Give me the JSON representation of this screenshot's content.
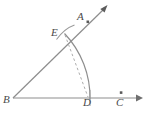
{
  "figure": {
    "type": "geometric-construction",
    "background_color": "#ffffff",
    "stroke_color": "#8d8d8d",
    "label_color": "#4a4a4a",
    "dashed_color": "#a8a8a8",
    "labels": {
      "A": "A",
      "B": "B",
      "C": "C",
      "D": "D",
      "E": "E"
    },
    "points": [
      {
        "name": "A",
        "label": "A",
        "x": 88,
        "y": 22,
        "marked": true
      },
      {
        "name": "B",
        "label": "B",
        "x": 13,
        "y": 98,
        "marked": false
      },
      {
        "name": "C",
        "label": "C",
        "x": 121,
        "y": 93,
        "marked": true
      },
      {
        "name": "D",
        "label": "D",
        "x": 89,
        "y": 98,
        "marked": false
      },
      {
        "name": "E",
        "label": "E",
        "x": 64,
        "y": 33,
        "marked": false
      }
    ],
    "rays": [
      {
        "name": "ray-BC",
        "from": "B",
        "through": "D",
        "to_x": 140,
        "to_y": 98,
        "arrow": true
      },
      {
        "name": "ray-BA",
        "from": "B",
        "through": "E",
        "to_x": 106,
        "to_y": 7,
        "arrow": true
      }
    ],
    "arcs": [
      {
        "name": "main-arc",
        "center": "B",
        "from": "E",
        "to": "D",
        "radius": 93,
        "style": "solid"
      },
      {
        "name": "construction-arc-at-E",
        "center": "D",
        "from_angle": 120,
        "to_angle": 165,
        "style": "solid"
      }
    ],
    "segments": [
      {
        "name": "chord-ED",
        "from": "E",
        "to": "D",
        "style": "dashed"
      }
    ]
  }
}
